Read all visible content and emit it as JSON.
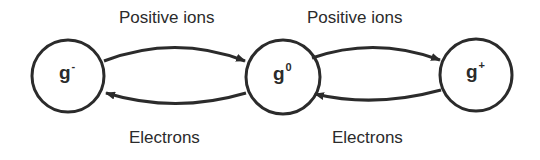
{
  "diagram": {
    "nodes": [
      {
        "id": "g_minus",
        "base": "g",
        "sup": "-",
        "label": "g-"
      },
      {
        "id": "g_zero",
        "base": "g",
        "sup": "0",
        "label": "g0"
      },
      {
        "id": "g_plus",
        "base": "g",
        "sup": "+",
        "label": "g+"
      }
    ],
    "edges": [
      {
        "from": "g_minus",
        "to": "g_zero",
        "label": "Positive ions"
      },
      {
        "from": "g_zero",
        "to": "g_minus",
        "label": "Electrons"
      },
      {
        "from": "g_zero",
        "to": "g_plus",
        "label": "Positive ions"
      },
      {
        "from": "g_plus",
        "to": "g_zero",
        "label": "Electrons"
      }
    ],
    "colors": {
      "stroke": "#2b2b2b",
      "background": "#ffffff"
    }
  }
}
